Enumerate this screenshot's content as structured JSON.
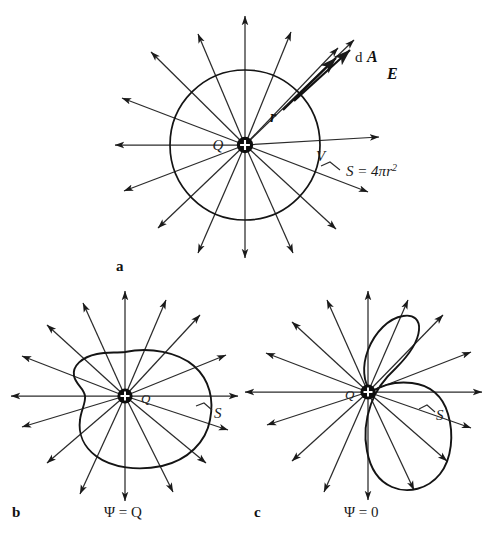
{
  "figure": {
    "title_caption": "",
    "background_color": "#ffffff",
    "ink_color": "#1a1a1a",
    "panels": [
      {
        "id": "a",
        "letter": "a",
        "letter_pos": [
          118,
          270
        ],
        "description": "spherical gaussian surface around point charge",
        "center": [
          245,
          145
        ],
        "charge_symbol": "+",
        "labels": [
          {
            "name": "charge-label",
            "text": "Q",
            "pos": [
              218,
              150
            ],
            "style": "math-italic"
          },
          {
            "name": "radius-label",
            "text": "r",
            "pos": [
              270,
              122
            ],
            "style": "math-italic-bold"
          },
          {
            "name": "volume-label",
            "text": "V",
            "pos": [
              320,
              160
            ],
            "style": "math-italic"
          },
          {
            "name": "area-element-label-d",
            "text": "d",
            "pos": [
              360,
              60
            ],
            "style": "math-upright"
          },
          {
            "name": "area-element-label-A",
            "text": "A",
            "pos": [
              372,
              60
            ],
            "style": "math-italic-bold"
          },
          {
            "name": "field-label",
            "text": "E",
            "pos": [
              392,
              75
            ],
            "style": "math-italic-bold"
          },
          {
            "name": "surface-area-label",
            "text": "S = 4πr",
            "pos": [
              344,
              175
            ],
            "style": "math-italic"
          },
          {
            "name": "surface-area-exponent",
            "text": "2",
            "pos": [
              398,
              168
            ],
            "style": "superscript"
          }
        ],
        "sphere_radius": 75,
        "num_field_lines": 16
      },
      {
        "id": "b",
        "letter": "b",
        "letter_pos": [
          14,
          512
        ],
        "description": "arbitrary closed surface enclosing the point charge",
        "center": [
          125,
          396
        ],
        "charge_symbol": "+",
        "labels": [
          {
            "name": "charge-label",
            "text": "Q",
            "pos": [
              144,
              402
            ],
            "style": "math-small"
          },
          {
            "name": "surface-label",
            "text": "S",
            "pos": [
              216,
              414
            ],
            "style": "math-italic"
          },
          {
            "name": "flux-label",
            "text": "Ψ = Q",
            "pos": [
              110,
              513
            ],
            "style": "flux-label"
          }
        ],
        "flux_value": "Q",
        "num_field_lines": 16
      },
      {
        "id": "c",
        "letter": "c",
        "letter_pos": [
          256,
          512
        ],
        "description": "arbitrary closed surface not enclosing the point charge",
        "center": [
          368,
          392
        ],
        "charge_symbol": "+",
        "labels": [
          {
            "name": "charge-label",
            "text": "Q",
            "pos": [
              348,
              398
            ],
            "style": "math-small"
          },
          {
            "name": "surface-label",
            "text": "S",
            "pos": [
              438,
              416
            ],
            "style": "math-italic"
          },
          {
            "name": "flux-label",
            "text": "Ψ = 0",
            "pos": [
              350,
              513
            ],
            "style": "flux-label"
          }
        ],
        "flux_value": "0",
        "num_field_lines": 16
      }
    ]
  }
}
